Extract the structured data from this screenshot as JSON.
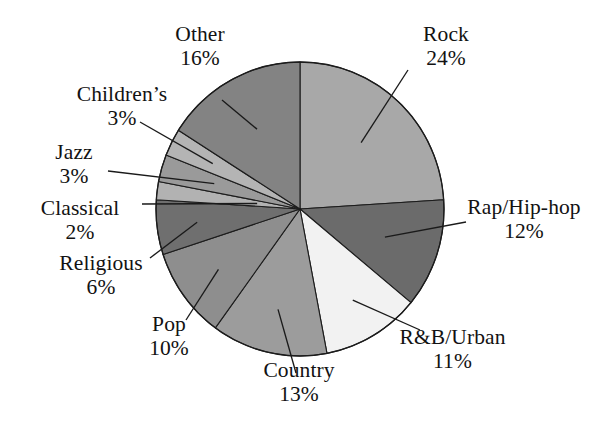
{
  "chart_data": {
    "type": "pie",
    "title": "",
    "subtitle": "",
    "xlabel": "",
    "ylabel": "",
    "legend_position": "none",
    "grid": false,
    "unit": "%",
    "start_angle_deg": 0,
    "direction": "clockwise",
    "categories": [
      "Rock",
      "Rap/Hip-hop",
      "R&B/Urban",
      "Country",
      "Pop",
      "Religious",
      "Classical",
      "Jazz",
      "Children's",
      "Other"
    ],
    "values": [
      24,
      12,
      11,
      13,
      10,
      6,
      2,
      3,
      3,
      16
    ],
    "total": 100,
    "slices": [
      {
        "label": "Rock",
        "value": 24,
        "pct_text": "24%",
        "color": "#a8a8a8",
        "label_pos": "right-top"
      },
      {
        "label": "Rap/Hip-hop",
        "value": 12,
        "pct_text": "12%",
        "color": "#6b6b6b",
        "label_pos": "right"
      },
      {
        "label": "R&B/Urban",
        "value": 11,
        "pct_text": "11%",
        "color": "#f2f2f2",
        "label_pos": "right-bottom"
      },
      {
        "label": "Country",
        "value": 13,
        "pct_text": "13%",
        "color": "#9c9c9c",
        "label_pos": "bottom"
      },
      {
        "label": "Pop",
        "value": 10,
        "pct_text": "10%",
        "color": "#8e8e8e",
        "label_pos": "left-bottom"
      },
      {
        "label": "Religious",
        "value": 6,
        "pct_text": "6%",
        "color": "#6f6f6f",
        "label_pos": "left-bottom2"
      },
      {
        "label": "Classical",
        "value": 2,
        "pct_text": "2%",
        "color": "#b2b2b2",
        "label_pos": "left"
      },
      {
        "label": "Jazz",
        "value": 3,
        "pct_text": "3%",
        "color": "#9a9a9a",
        "label_pos": "left-top2"
      },
      {
        "label": "Children's",
        "value": 3,
        "pct_text": "3%",
        "color": "#b4b4b4",
        "label_pos": "left-top"
      },
      {
        "label": "Other",
        "value": 16,
        "pct_text": "16%",
        "color": "#838383",
        "label_pos": "top"
      }
    ]
  },
  "labels": {
    "rock": {
      "name": "Rock",
      "pct": "24%"
    },
    "rap": {
      "name": "Rap/Hip-hop",
      "pct": "12%"
    },
    "rnb": {
      "name": "R&B/Urban",
      "pct": "11%"
    },
    "country": {
      "name": "Country",
      "pct": "13%"
    },
    "pop": {
      "name": "Pop",
      "pct": "10%"
    },
    "religious": {
      "name": "Religious",
      "pct": "6%"
    },
    "classical": {
      "name": "Classical",
      "pct": "2%"
    },
    "jazz": {
      "name": "Jazz",
      "pct": "3%"
    },
    "childrens": {
      "name": "Children’s",
      "pct": "3%"
    },
    "other": {
      "name": "Other",
      "pct": "16%"
    }
  },
  "colors": {
    "background": "#ffffff",
    "outline": "#1c1c1c",
    "text": "#121212",
    "leader": "#1a1a1a"
  }
}
